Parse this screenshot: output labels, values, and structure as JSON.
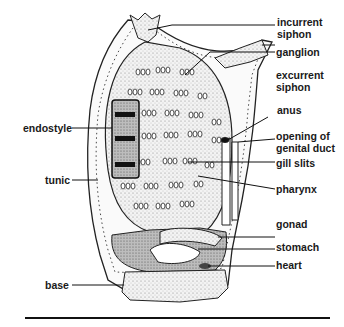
{
  "diagram": {
    "labels_right": [
      {
        "id": "incurrent-siphon",
        "line1": "incurrent",
        "line2": "siphon"
      },
      {
        "id": "ganglion",
        "line1": "ganglion"
      },
      {
        "id": "excurrent-siphon",
        "line1": "excurrent",
        "line2": "siphon"
      },
      {
        "id": "anus",
        "line1": "anus"
      },
      {
        "id": "opening-of-genital-duct",
        "line1": "opening of",
        "line2": "genital duct"
      },
      {
        "id": "gill-slits",
        "line1": "gill slits"
      },
      {
        "id": "pharynx",
        "line1": "pharynx"
      },
      {
        "id": "gonad",
        "line1": "gonad"
      },
      {
        "id": "stomach",
        "line1": "stomach"
      },
      {
        "id": "heart",
        "line1": "heart"
      }
    ],
    "labels_left": [
      {
        "id": "endostyle",
        "line1": "endostyle"
      },
      {
        "id": "tunic",
        "line1": "tunic"
      },
      {
        "id": "base",
        "line1": "base"
      }
    ]
  }
}
